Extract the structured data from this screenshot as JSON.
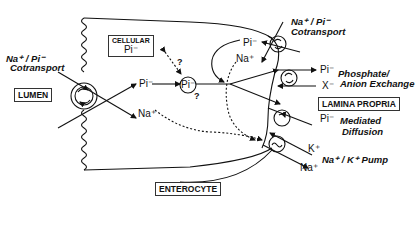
{
  "figure": {
    "regions": {
      "lumen": "LUMEN",
      "enterocyte": "ENTEROCYTE",
      "lamina_propria": "LAMINA PROPRIA",
      "cellular_pool_title": "CELLULAR",
      "cellular_pool_ion": "Pi⁻"
    },
    "apical": {
      "transporter_label_line1": "Na⁺ / Pi⁻",
      "transporter_label_line2": "Cotransport"
    },
    "intracellular": {
      "pi_entry": "Pi⁻",
      "na_entry": "Na⁺",
      "pi_pool": "Pi⁻",
      "question_upper": "?",
      "question_lower": "?",
      "pi_recycle": "Pi⁻",
      "na_recycle": "Na⁺"
    },
    "basolateral": {
      "cotransport_line1": "Na⁺ / Pi⁻",
      "cotransport_line2": "Cotransport",
      "exchange_pi": "Pi⁻",
      "exchange_x": "X⁻",
      "exchange_line1": "Phosphate/",
      "exchange_line2": "Anion Exchange",
      "diffusion_pi": "Pi⁻",
      "diffusion_line1": "Mediated",
      "diffusion_line2": "Diffusion",
      "pump_k": "K⁺",
      "pump_na": "Na⁺",
      "pump_label": "Na⁺ / K⁺ Pump"
    },
    "icons": {
      "apical_transporter": "rotating-arrows-circle",
      "basolateral_cotransporter": "rotating-arrows-circle",
      "exchanger": "rotating-arrows-circle",
      "diffusion_carrier": "single-arrow-circle",
      "pump": "tilde-circle"
    },
    "colors": {
      "line": "#111111",
      "background": "#ffffff"
    }
  }
}
